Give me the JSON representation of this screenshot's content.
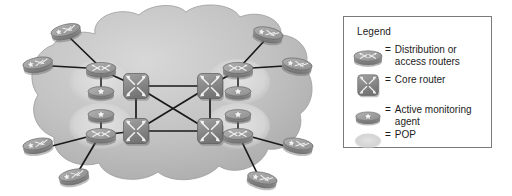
{
  "diagram": {
    "cloud_label": "",
    "colors": {
      "cloud_fill": "#b9b9b9",
      "cloud_fill_light": "#cfcfcf",
      "pop_halo": "#d6d6d6",
      "router_body": "#8a8a8a",
      "router_top": "#a5a5a5",
      "router_dark": "#6e6e6e",
      "core_body": "#8f8f8f",
      "link": "#1a1a1a",
      "legend_border": "#7b7b7b",
      "text": "#1c1c1c",
      "background": "#ffffff"
    },
    "nodes": {
      "core_routers": [
        {
          "id": "core-nw",
          "x": 136,
          "y": 86
        },
        {
          "id": "core-ne",
          "x": 210,
          "y": 86
        },
        {
          "id": "core-sw",
          "x": 136,
          "y": 131
        },
        {
          "id": "core-se",
          "x": 210,
          "y": 131
        }
      ],
      "distribution_routers": [
        {
          "id": "dist-nw",
          "x": 101,
          "y": 70
        },
        {
          "id": "dist-ne",
          "x": 238,
          "y": 70
        },
        {
          "id": "dist-sw",
          "x": 101,
          "y": 135
        },
        {
          "id": "dist-se",
          "x": 238,
          "y": 135
        }
      ],
      "monitoring_agents": [
        {
          "id": "agent-nw",
          "x": 101,
          "y": 91
        },
        {
          "id": "agent-ne",
          "x": 238,
          "y": 91
        },
        {
          "id": "agent-sw",
          "x": 101,
          "y": 117
        },
        {
          "id": "agent-se",
          "x": 238,
          "y": 117
        }
      ],
      "access_routers": [
        {
          "id": "access-1",
          "x": 66,
          "y": 32
        },
        {
          "id": "access-2",
          "x": 38,
          "y": 65
        },
        {
          "id": "access-3",
          "x": 38,
          "y": 146
        },
        {
          "id": "access-4",
          "x": 74,
          "y": 177
        },
        {
          "id": "access-5",
          "x": 268,
          "y": 35
        },
        {
          "id": "access-6",
          "x": 297,
          "y": 66
        },
        {
          "id": "access-7",
          "x": 298,
          "y": 146
        },
        {
          "id": "access-8",
          "x": 262,
          "y": 180
        }
      ]
    },
    "pops": [
      {
        "id": "pop-nw",
        "cx": 101,
        "cy": 82,
        "rx": 31,
        "ry": 22
      },
      {
        "id": "pop-ne",
        "cx": 238,
        "cy": 82,
        "rx": 31,
        "ry": 22
      },
      {
        "id": "pop-sw",
        "cx": 101,
        "cy": 126,
        "rx": 31,
        "ry": 22
      },
      {
        "id": "pop-se",
        "cx": 238,
        "cy": 126,
        "rx": 31,
        "ry": 22
      }
    ],
    "links": {
      "core_mesh": [
        [
          "core-nw",
          "core-ne"
        ],
        [
          "core-sw",
          "core-se"
        ],
        [
          "core-nw",
          "core-sw"
        ],
        [
          "core-ne",
          "core-se"
        ],
        [
          "core-nw",
          "core-se"
        ],
        [
          "core-ne",
          "core-sw"
        ]
      ],
      "dist_to_core": [
        [
          "dist-nw",
          "core-nw"
        ],
        [
          "dist-ne",
          "core-ne"
        ],
        [
          "dist-sw",
          "core-sw"
        ],
        [
          "dist-se",
          "core-se"
        ]
      ],
      "dist_to_agent": [
        [
          "dist-nw",
          "agent-nw"
        ],
        [
          "dist-ne",
          "agent-ne"
        ],
        [
          "dist-sw",
          "agent-sw"
        ],
        [
          "dist-se",
          "agent-se"
        ]
      ],
      "access_to_dist": [
        [
          "access-1",
          "dist-nw"
        ],
        [
          "access-2",
          "dist-nw"
        ],
        [
          "access-3",
          "dist-sw"
        ],
        [
          "access-4",
          "dist-sw"
        ],
        [
          "access-5",
          "dist-ne"
        ],
        [
          "access-6",
          "dist-ne"
        ],
        [
          "access-7",
          "dist-se"
        ],
        [
          "access-8",
          "dist-se"
        ]
      ]
    }
  },
  "legend": {
    "title": "Legend",
    "equals": "=",
    "items": [
      {
        "icon": "distribution-router-icon",
        "label": "Distribution or access routers"
      },
      {
        "icon": "core-router-icon",
        "label": "Core router"
      },
      {
        "icon": "monitoring-agent-icon",
        "label": "Active monitoring agent"
      },
      {
        "icon": "pop-ellipse-icon",
        "label": "POP"
      }
    ]
  }
}
